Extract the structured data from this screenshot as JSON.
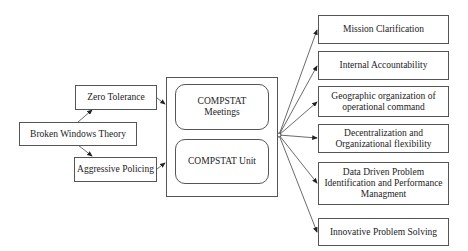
{
  "diagram": {
    "left": {
      "zero_tolerance": "Zero Tolerance",
      "broken_windows": "Broken Windows Theory",
      "aggressive_policing": "Aggressive Policing"
    },
    "center": {
      "meetings": "COMPSTAT\nMeetings",
      "unit": "COMPSTAT Unit"
    },
    "right": [
      "Mission Clarification",
      "Internal Accountability",
      "Geographic organization of\noperational command",
      "Decentralization and\nOrganizational flexibility",
      "Data Driven Problem\nIdentification and Performance\nManagment",
      "Innovative Problem Solving"
    ],
    "colors": {
      "stroke": "#555555",
      "background": "#ffffff",
      "text": "#222222"
    }
  }
}
